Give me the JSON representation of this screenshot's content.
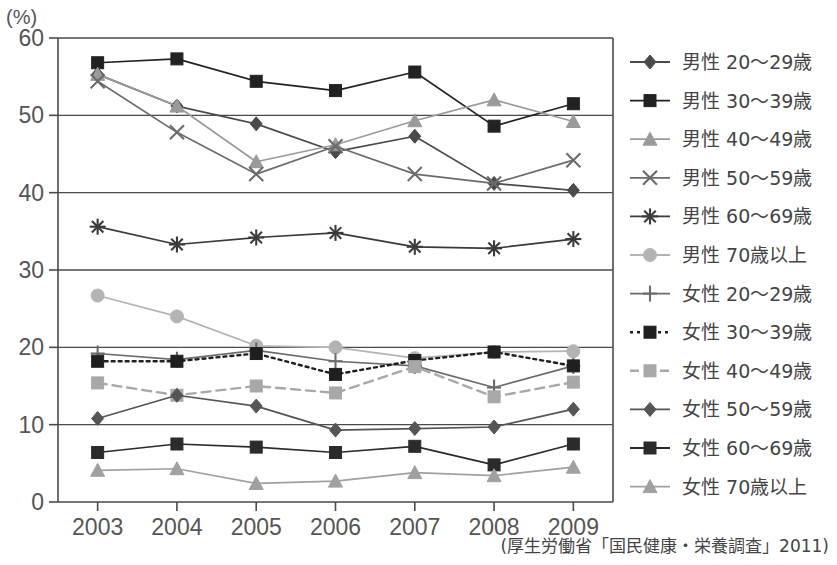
{
  "axis": {
    "unit_label": "(%)",
    "y_ticks": [
      "0",
      "10",
      "20",
      "30",
      "40",
      "50",
      "60"
    ],
    "y_values": [
      0,
      10,
      20,
      30,
      40,
      50,
      60
    ],
    "x_ticks": [
      "2003",
      "2004",
      "2005",
      "2006",
      "2007",
      "2008",
      "2009"
    ]
  },
  "source_note": "(厚生労働省「国民健康・栄養調査」2011)",
  "legend": {
    "items": [
      {
        "label": "男性  20〜29歳",
        "marker": "diamond",
        "color": "#4a4a4a",
        "dash": "none"
      },
      {
        "label": "男性  30〜39歳",
        "marker": "square",
        "color": "#222222",
        "dash": "none"
      },
      {
        "label": "男性  40〜49歳",
        "marker": "triangle",
        "color": "#9a9a9a",
        "dash": "none"
      },
      {
        "label": "男性  50〜59歳",
        "marker": "cross",
        "color": "#6b6b6b",
        "dash": "none"
      },
      {
        "label": "男性  60〜69歳",
        "marker": "asterisk",
        "color": "#3a3a3a",
        "dash": "none"
      },
      {
        "label": "男性  70歳以上",
        "marker": "circle",
        "color": "#b4b4b4",
        "dash": "none"
      },
      {
        "label": "女性  20〜29歳",
        "marker": "plus",
        "color": "#6b6b6b",
        "dash": "none"
      },
      {
        "label": "女性  30〜39歳",
        "marker": "square",
        "color": "#1f1f1f",
        "dash": "dotted"
      },
      {
        "label": "女性  40〜49歳",
        "marker": "square",
        "color": "#a8a8a8",
        "dash": "dashed"
      },
      {
        "label": "女性  50〜59歳",
        "marker": "diamond",
        "color": "#555555",
        "dash": "none"
      },
      {
        "label": "女性  60〜69歳",
        "marker": "square",
        "color": "#2b2b2b",
        "dash": "none"
      },
      {
        "label": "女性  70歳以上",
        "marker": "triangle",
        "color": "#a0a0a0",
        "dash": "none"
      }
    ]
  },
  "chart_data": {
    "type": "line",
    "title": "",
    "xlabel": "",
    "ylabel": "(%)",
    "ylim": [
      0,
      60
    ],
    "grid": true,
    "legend_position": "right",
    "x": [
      "2003",
      "2004",
      "2005",
      "2006",
      "2007",
      "2008",
      "2009"
    ],
    "series": [
      {
        "name": "男性  20〜29歳",
        "marker": "diamond",
        "color": "#4a4a4a",
        "dash": "none",
        "values": [
          55.3,
          51.2,
          48.9,
          45.3,
          47.3,
          41.2,
          40.3
        ]
      },
      {
        "name": "男性  30〜39歳",
        "marker": "square",
        "color": "#222222",
        "dash": "none",
        "values": [
          56.8,
          57.3,
          54.4,
          53.2,
          55.6,
          48.6,
          51.5
        ]
      },
      {
        "name": "男性  40〜49歳",
        "marker": "triangle",
        "color": "#9a9a9a",
        "dash": "none",
        "values": [
          55.3,
          51.2,
          44.0,
          46.2,
          49.3,
          52.0,
          49.2
        ]
      },
      {
        "name": "男性  50〜59歳",
        "marker": "cross",
        "color": "#6b6b6b",
        "dash": "none",
        "values": [
          54.4,
          47.8,
          42.4,
          46.0,
          42.4,
          41.2,
          44.2
        ]
      },
      {
        "name": "男性  60〜69歳",
        "marker": "asterisk",
        "color": "#3a3a3a",
        "dash": "none",
        "values": [
          35.6,
          33.3,
          34.2,
          34.8,
          33.0,
          32.8,
          34.0
        ]
      },
      {
        "name": "男性  70歳以上",
        "marker": "circle",
        "color": "#b4b4b4",
        "dash": "none",
        "values": [
          26.7,
          24.0,
          20.2,
          20.0,
          18.6,
          19.4,
          19.5
        ]
      },
      {
        "name": "女性  20〜29歳",
        "marker": "plus",
        "color": "#6b6b6b",
        "dash": "none",
        "values": [
          19.2,
          18.4,
          19.6,
          18.2,
          17.6,
          14.8,
          17.6
        ]
      },
      {
        "name": "女性  30〜39歳",
        "marker": "square",
        "color": "#1f1f1f",
        "dash": "dotted",
        "values": [
          18.2,
          18.2,
          19.2,
          16.5,
          18.3,
          19.4,
          17.6
        ]
      },
      {
        "name": "女性  40〜49歳",
        "marker": "square",
        "color": "#a8a8a8",
        "dash": "dashed",
        "values": [
          15.4,
          13.8,
          15.0,
          14.1,
          17.5,
          13.6,
          15.5
        ]
      },
      {
        "name": "女性  50〜59歳",
        "marker": "diamond",
        "color": "#555555",
        "dash": "none",
        "values": [
          10.8,
          13.8,
          12.4,
          9.3,
          9.5,
          9.7,
          12.0
        ]
      },
      {
        "name": "女性  60〜69歳",
        "marker": "square",
        "color": "#2b2b2b",
        "dash": "none",
        "values": [
          6.4,
          7.5,
          7.1,
          6.4,
          7.2,
          4.8,
          7.5
        ]
      },
      {
        "name": "女性  70歳以上",
        "marker": "triangle",
        "color": "#a0a0a0",
        "dash": "none",
        "values": [
          4.1,
          4.3,
          2.4,
          2.7,
          3.8,
          3.4,
          4.5
        ]
      }
    ]
  }
}
